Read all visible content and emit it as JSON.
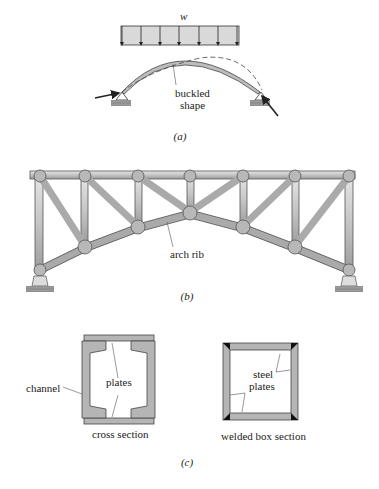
{
  "figure_a": {
    "load_label": "w",
    "buckled_label_line1": "buckled",
    "buckled_label_line2": "shape",
    "caption": "(a)"
  },
  "figure_b": {
    "arch_rib_label": "arch rib",
    "caption": "(b)"
  },
  "figure_c": {
    "channel_label": "channel",
    "plates_label": "plates",
    "cross_section_label": "cross section",
    "steel_label_line1": "steel",
    "steel_label_line2": "plates",
    "welded_box_label": "welded box section",
    "caption": "(c)"
  },
  "colors": {
    "member_fill": "#c8c8c8",
    "member_stroke": "#555555",
    "load_fill": "#d9d9d9",
    "ink": "#222222"
  }
}
